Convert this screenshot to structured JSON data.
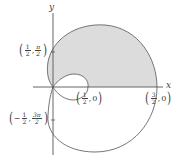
{
  "figure": {
    "type": "polar-curve",
    "colors": {
      "curve": "#666666",
      "fill": "#dddddd",
      "axis": "#555555"
    }
  },
  "axes": {
    "x_label": "x",
    "y_label": "y"
  },
  "points": [
    {
      "id": "p1",
      "num_a": "1",
      "den_a": "2",
      "num_b": "π",
      "den_b": "2",
      "sign": ""
    },
    {
      "id": "p2",
      "num_a": "1",
      "den_a": "2",
      "num_b": "3π",
      "den_b": "2",
      "sign": "−"
    },
    {
      "id": "p3",
      "num_a": "1",
      "den_a": "2",
      "second": "0"
    },
    {
      "id": "p4",
      "num_a": "3",
      "den_a": "2",
      "second": "0"
    }
  ],
  "punct": {
    "open": "(",
    "close": ")",
    "comma": ","
  }
}
